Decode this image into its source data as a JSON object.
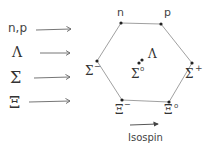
{
  "diagram": {
    "row_labels": [
      {
        "id": "nucleons",
        "label": "n,p"
      },
      {
        "id": "lambda",
        "label": "Λ"
      },
      {
        "id": "sigma",
        "label": "Σ"
      },
      {
        "id": "xi",
        "label": "Ξ"
      }
    ],
    "particles": {
      "n": "n",
      "p": "p",
      "sigma_minus": "Σ",
      "sigma_minus_charge": "−",
      "sigma_zero": "Σ",
      "sigma_zero_charge": "o",
      "sigma_plus": "Σ",
      "sigma_plus_charge": "+",
      "lambda": "Λ",
      "xi_minus": "Ξ",
      "xi_minus_charge": "−",
      "xi_zero": "Ξ",
      "xi_zero_charge": "o"
    },
    "axis_label": "Isospin",
    "colors": {
      "ink": "#444444",
      "line": "#777777",
      "dot": "#222222"
    }
  }
}
